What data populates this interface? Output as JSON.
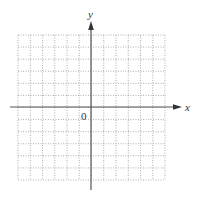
{
  "chart_data": {
    "type": "scatter",
    "title": "",
    "xlabel": "x",
    "ylabel": "y",
    "origin_label": "0",
    "grid": true,
    "grid_style": "dotted",
    "grid_cells_x": 12,
    "grid_cells_y": 12,
    "xlim": [
      -6,
      6
    ],
    "ylim": [
      -6,
      6
    ],
    "series": [],
    "legend": null
  },
  "colors": {
    "axis": "#555555",
    "grid": "#9a9a9a",
    "text": "#333333"
  }
}
